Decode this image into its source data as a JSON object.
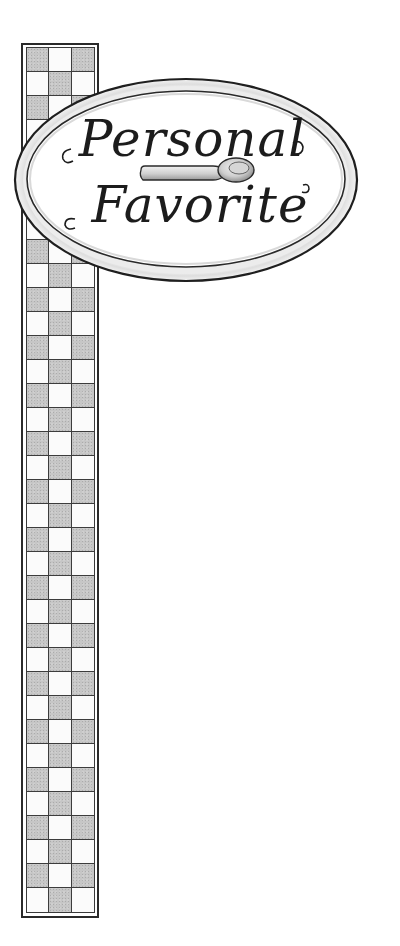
{
  "illustration": {
    "description": "Hand-drawn pencil illustration of a tall checkered vertical banner with an oval sign",
    "strip": {
      "columns": 3,
      "rows": 36,
      "first_row_pattern": [
        "gray",
        "white",
        "gray"
      ],
      "colors": {
        "gray": "#c6c6c6",
        "white": "#fbfbfb",
        "border": "#2a2a2a"
      }
    },
    "sign": {
      "shape": "oval",
      "line1": "Personal",
      "line2": "Favorite",
      "icon": "spoon-icon",
      "colors": {
        "rim": "#e9e9e9",
        "outline": "#1f1f1f",
        "face": "#ffffff",
        "ink": "#1c1c1c"
      }
    }
  }
}
